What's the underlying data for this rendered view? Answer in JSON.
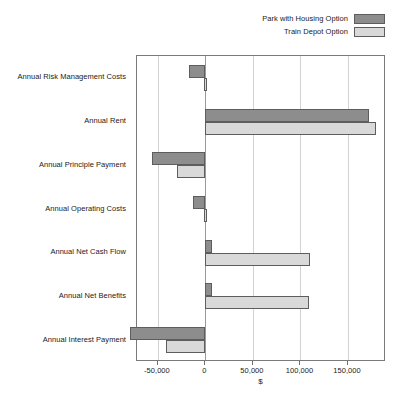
{
  "chart_data": {
    "type": "bar",
    "orientation": "horizontal",
    "title": "",
    "xlabel": "$",
    "ylabel": "",
    "xlim": [
      -72000,
      190000
    ],
    "xticks": [
      -50000,
      0,
      50000,
      100000,
      150000
    ],
    "xticklabels": [
      "-50,000",
      "0",
      "50,000",
      "100,000",
      "150,000"
    ],
    "grid": true,
    "grid_axis": "x",
    "legend_position": "top-right",
    "categories": [
      "Annual Risk Management Costs",
      "Annual Rent",
      "Annual Principle Payment",
      "Annual Operating Costs",
      "Annual Net Cash Flow",
      "Annual Net Benefits",
      "Annual Interest Payment"
    ],
    "series": [
      {
        "name": "Park with Housing Option",
        "color": "#8d8d8d",
        "values": [
          -17000,
          172000,
          -56000,
          -13000,
          7000,
          7000,
          -79000
        ]
      },
      {
        "name": "Train Depot Option",
        "color": "#d9d9d9",
        "values": [
          -1000,
          180000,
          -30000,
          -1000,
          110000,
          109000,
          -42000
        ]
      }
    ]
  },
  "legend": {
    "items": [
      {
        "label": "Park with Housing Option",
        "swatch": "#8d8d8d"
      },
      {
        "label": "Train Depot Option",
        "swatch": "#d9d9d9"
      }
    ]
  },
  "axis": {
    "x_title": "$",
    "tick_labels": [
      "-50,000",
      "0",
      "50,000",
      "100,000",
      "150,000"
    ]
  }
}
